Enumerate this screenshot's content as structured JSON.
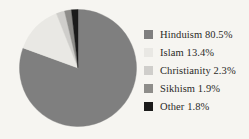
{
  "background_color": "#f6f5f1",
  "chart_data": {
    "type": "pie",
    "title": "",
    "subtitle": "",
    "xlabel": "",
    "ylabel": "",
    "grid": false,
    "legend_position": "right",
    "start_angle_deg": 0,
    "direction": "clockwise",
    "unit": "%",
    "categories": [
      "Hinduism",
      "Islam",
      "Christianity",
      "Sikhism",
      "Other"
    ],
    "values": [
      80.5,
      13.4,
      2.3,
      1.9,
      1.8
    ],
    "colors": [
      "#7f7f7f",
      "#e9e8e4",
      "#cfcecb",
      "#8e8d8a",
      "#1b1b1b"
    ],
    "slices": [
      {
        "label": "Hinduism",
        "value": 80.5,
        "display": "80.5%",
        "color": "#7f7f7f"
      },
      {
        "label": "Islam",
        "value": 13.4,
        "display": "13.4%",
        "color": "#e9e8e4"
      },
      {
        "label": "Christianity",
        "value": 2.3,
        "display": "2.3%",
        "color": "#cfcecb"
      },
      {
        "label": "Sikhism",
        "value": 1.9,
        "display": "1.9%",
        "color": "#8e8d8a"
      },
      {
        "label": "Other",
        "value": 1.8,
        "display": "1.8%",
        "color": "#1b1b1b"
      }
    ]
  },
  "legend": {
    "items": [
      {
        "text": "Hinduism 80.5%",
        "color": "#7f7f7f"
      },
      {
        "text": "Islam 13.4%",
        "color": "#e9e8e4"
      },
      {
        "text": "Christianity 2.3%",
        "color": "#cfcecb"
      },
      {
        "text": "Sikhism 1.9%",
        "color": "#8e8d8a"
      },
      {
        "text": "Other 1.8%",
        "color": "#1b1b1b"
      }
    ]
  }
}
